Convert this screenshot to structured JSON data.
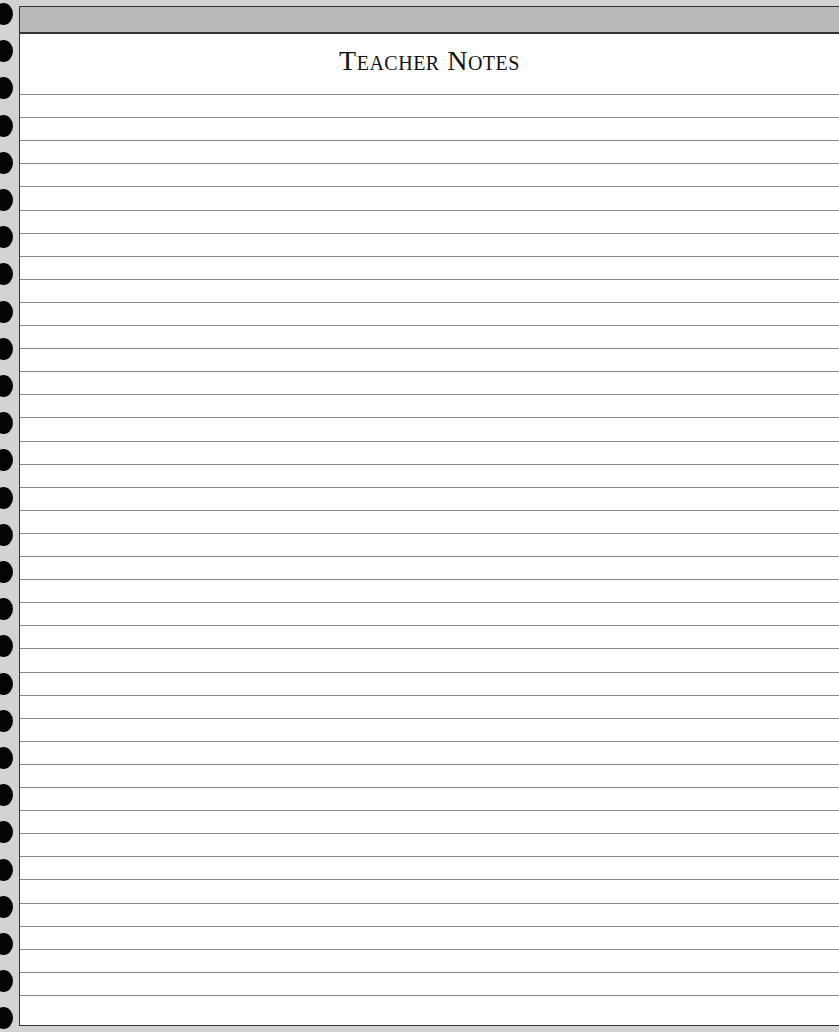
{
  "header": {
    "title": "Teacher Notes"
  },
  "layout": {
    "line_count": 40,
    "first_line_y": 87,
    "line_spacing": 23.1,
    "hole_count": 28,
    "first_hole_y": 3,
    "hole_spacing": 37.2
  },
  "colors": {
    "background": "#d3d3d3",
    "topbar": "#b9b9b9",
    "rule": "#8a8a8a",
    "hole": "#050505"
  }
}
